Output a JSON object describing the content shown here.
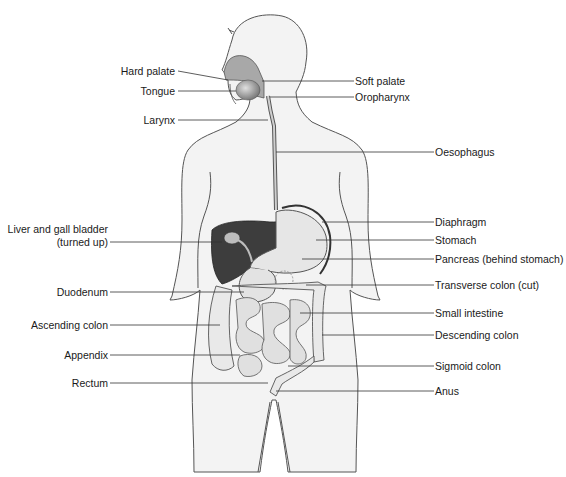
{
  "diagram": {
    "colors": {
      "skin": "#f2f2f2",
      "outline": "#555555",
      "liver": "#3d3d3d",
      "organ_light": "#e8e8e8",
      "organ_mid": "#bdbdbd",
      "leader_line": "#333333"
    },
    "labels_left": [
      {
        "id": "hard-palate",
        "text": "Hard palate"
      },
      {
        "id": "tongue",
        "text": "Tongue"
      },
      {
        "id": "larynx",
        "text": "Larynx"
      },
      {
        "id": "liver-line1",
        "text": "Liver and gall bladder"
      },
      {
        "id": "liver-line2",
        "text": "(turned up)"
      },
      {
        "id": "duodenum",
        "text": "Duodenum"
      },
      {
        "id": "ascending-colon",
        "text": "Ascending colon"
      },
      {
        "id": "appendix",
        "text": "Appendix"
      },
      {
        "id": "rectum",
        "text": "Rectum"
      }
    ],
    "labels_right": [
      {
        "id": "soft-palate",
        "text": "Soft palate"
      },
      {
        "id": "oropharynx",
        "text": "Oropharynx"
      },
      {
        "id": "oesophagus",
        "text": "Oesophagus"
      },
      {
        "id": "diaphragm",
        "text": "Diaphragm"
      },
      {
        "id": "stomach",
        "text": "Stomach"
      },
      {
        "id": "pancreas",
        "text": "Pancreas (behind stomach)"
      },
      {
        "id": "transverse-colon",
        "text": "Transverse colon (cut)"
      },
      {
        "id": "small-intestine",
        "text": "Small intestine"
      },
      {
        "id": "descending-colon",
        "text": "Descending colon"
      },
      {
        "id": "sigmoid-colon",
        "text": "Sigmoid colon"
      },
      {
        "id": "anus",
        "text": "Anus"
      }
    ]
  }
}
